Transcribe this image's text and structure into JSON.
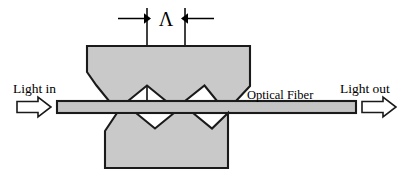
{
  "figure": {
    "background_color": "#ffffff",
    "block_fill_color": "#c9c9c9",
    "fiber_fill_color": "#c4c4c4",
    "outline_color": "#1a1a1a"
  },
  "labels": {
    "light_in": "Light in",
    "light_out": "Light out",
    "optical_fiber": "Optical Fiber",
    "period_symbol": "Λ"
  },
  "icons": {
    "light_in_arrow": "block-arrow-right-icon",
    "light_out_arrow": "block-arrow-right-icon",
    "dimension_left_arrow": "dimension-arrow-right-icon",
    "dimension_right_arrow": "dimension-arrow-left-icon"
  },
  "geometry": {
    "upper_block": {
      "teeth_count": 4,
      "left": 87,
      "right": 250,
      "top": 46,
      "baseline": 101
    },
    "lower_block": {
      "teeth_count": 3,
      "left": 105,
      "right": 228,
      "bottom": 168,
      "baseline": 113
    },
    "fiber": {
      "left": 57,
      "right": 356,
      "top": 101,
      "bottom": 113
    },
    "period_markers": {
      "left_x": 147,
      "right_x": 185
    }
  }
}
